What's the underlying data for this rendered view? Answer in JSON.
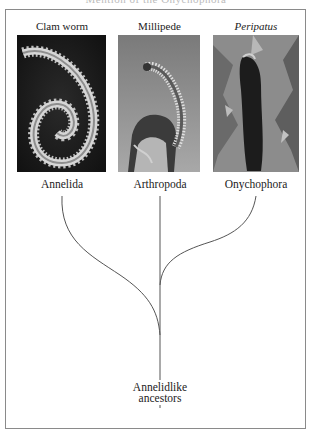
{
  "figure": {
    "top_cutoff_text": "Mention of the Onychophora",
    "taxa": [
      {
        "common_name": "Clam worm",
        "phylum": "Annelida",
        "italic": false,
        "photo_icon": "clam-worm-photo"
      },
      {
        "common_name": "Millipede",
        "phylum": "Arthropoda",
        "italic": false,
        "photo_icon": "millipede-photo"
      },
      {
        "common_name": "Peripatus",
        "phylum": "Onychophora",
        "italic": true,
        "photo_icon": "peripatus-photo"
      }
    ],
    "root": {
      "line1": "Annelidlike",
      "line2": "ancestors"
    },
    "colors": {
      "line": "#555555",
      "frame": "#8a8a8a"
    }
  }
}
